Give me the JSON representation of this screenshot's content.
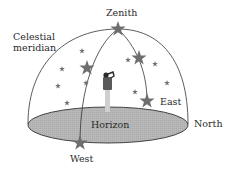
{
  "diagram": {
    "labels": {
      "zenith": "Zenith",
      "celestial_meridian": "Celestial\nmeridian",
      "east": "East",
      "north": "North",
      "horizon": "Horizon",
      "west": "West"
    },
    "colors": {
      "outline": "#333333",
      "horizon_fill": "#b5b5b5",
      "star": "#6e6e6e",
      "person": "#5a5a5a",
      "person_legs": "#cfcfcf",
      "text": "#2a2a2a"
    },
    "elements": [
      {
        "type": "dome",
        "description": "hemisphere over the horizon plane"
      },
      {
        "type": "ellipse",
        "name": "horizon-plane",
        "label": "Horizon"
      },
      {
        "type": "arc",
        "name": "celestial-meridian",
        "label": "Celestial meridian"
      },
      {
        "type": "arc",
        "name": "star-path",
        "from": "East",
        "to": "West",
        "through": "Zenith"
      },
      {
        "type": "figure",
        "name": "observer",
        "position": "center of horizon plane"
      },
      {
        "type": "star",
        "name": "zenith-star",
        "label": "Zenith"
      },
      {
        "type": "star",
        "name": "east-star",
        "label": "East"
      },
      {
        "type": "star",
        "name": "west-star",
        "label": "West"
      }
    ]
  }
}
